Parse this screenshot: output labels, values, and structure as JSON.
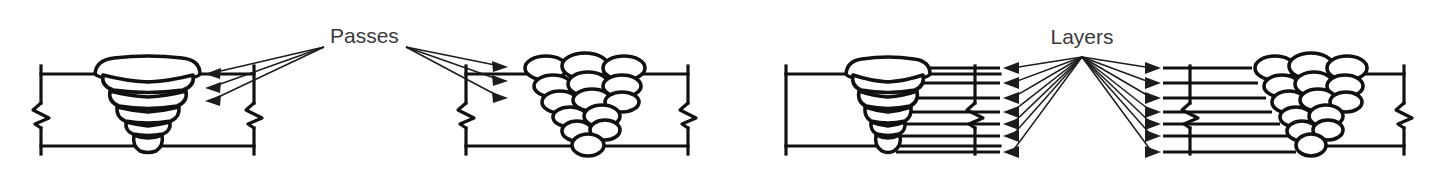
{
  "figure": {
    "type": "technical-line-diagram",
    "background_color": "#ffffff",
    "ink_color": "#111111",
    "text_color": "#3a3a3a",
    "width": 1447,
    "height": 176
  },
  "callouts": [
    {
      "id": "passes",
      "label": "Passes",
      "x": 330,
      "y": 37,
      "left_apex": {
        "x": 324,
        "y": 47
      },
      "right_apex": {
        "x": 406,
        "y": 47
      },
      "left_arrow_count": 3,
      "right_arrow_count": 3
    },
    {
      "id": "layers",
      "label": "Layers",
      "x": 1082,
      "y": 38,
      "left_apex": {
        "x": 1082,
        "y": 57
      },
      "right_apex": {
        "x": 1082,
        "y": 57
      },
      "left_arrow_count": 7,
      "right_arrow_count": 7
    }
  ],
  "welds": [
    {
      "id": "weld-1",
      "name": "groove-weld-stringer-layers",
      "description": "V-groove weld shown with wide stacked stringer-bead layers",
      "plate": {
        "left": 41,
        "right": 254,
        "top": 74,
        "bottom": 146
      },
      "break_symbols": [
        41,
        254
      ],
      "groove": {
        "top_left": 95,
        "top_right": 200,
        "root_center": 148
      },
      "layer_count": 5,
      "bead_style": "wide-trapezoid-layer"
    },
    {
      "id": "weld-2",
      "name": "groove-weld-individual-passes",
      "description": "V-groove weld shown with many individual oval bead passes",
      "plate": {
        "left": 466,
        "right": 688,
        "top": 74,
        "bottom": 146
      },
      "break_symbols": [
        466,
        688
      ],
      "groove": {
        "top_left": 530,
        "top_right": 638,
        "root_center": 584
      },
      "row_counts": [
        3,
        3,
        3,
        2,
        2,
        1
      ],
      "bead_style": "individual-oval-bead"
    },
    {
      "id": "weld-3",
      "name": "groove-weld-layers-left",
      "description": "V-groove weld with layer leader lines extending to the right",
      "plate": {
        "left": 786,
        "right": 1000,
        "top": 74,
        "bottom": 146
      },
      "break_symbols": [
        786,
        975
      ],
      "groove": {
        "top_left": 846,
        "top_right": 930,
        "root_center": 888
      },
      "layer_count": 5,
      "leader_count": 7,
      "leader_direction": "right",
      "bead_style": "wide-trapezoid-layer"
    },
    {
      "id": "weld-4",
      "name": "groove-weld-layers-right",
      "description": "V-groove weld with layer leader lines extending to the left",
      "plate": {
        "left": 1163,
        "right": 1404,
        "top": 74,
        "bottom": 146
      },
      "break_symbols": [
        1190,
        1404
      ],
      "groove": {
        "top_left": 1262,
        "top_right": 1352,
        "root_center": 1305
      },
      "row_counts": [
        3,
        3,
        3,
        2,
        2,
        1
      ],
      "leader_count": 7,
      "leader_direction": "left",
      "bead_style": "individual-oval-bead"
    }
  ]
}
